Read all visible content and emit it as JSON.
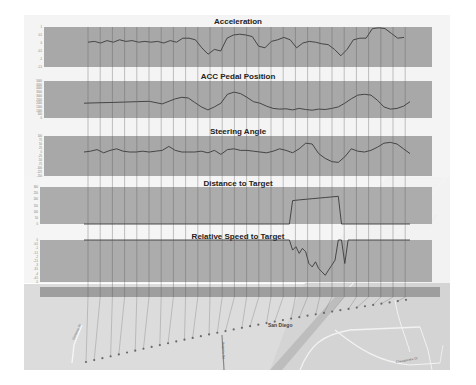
{
  "figure": {
    "colors": {
      "plot_bg": "#a8a8a8",
      "trace": "#3a3a3a",
      "panel_bg": "#f4f4f4",
      "map_bg": "#dcdcdc",
      "route_dots": "#6a6a6a",
      "sync_lines": "#555555"
    }
  },
  "chart_data": [
    {
      "type": "line",
      "title": "Acceleration",
      "xlabel": "",
      "ylabel": "",
      "yticks": [
        "1",
        "0.5",
        "0",
        "-0.5",
        "-1",
        "-1.5"
      ],
      "ylim": [
        -1.5,
        1
      ],
      "grid": false,
      "x": [
        0,
        2,
        4,
        6,
        8,
        10,
        12,
        14,
        16,
        18,
        20,
        22,
        24,
        26,
        28,
        30,
        32,
        34,
        36,
        38,
        40,
        42,
        44,
        46,
        48,
        50,
        52,
        54,
        56,
        58,
        60,
        62,
        64,
        66,
        68,
        70,
        72,
        74,
        76,
        78,
        80,
        82,
        84,
        86,
        88,
        90,
        92,
        94,
        96,
        98,
        100
      ],
      "values": [
        0.05,
        0.1,
        0.0,
        0.15,
        0.05,
        0.2,
        0.1,
        0.15,
        0.05,
        0.1,
        0.05,
        0.1,
        0.0,
        0.15,
        0.05,
        0.3,
        0.3,
        0.2,
        -0.3,
        -0.7,
        -0.4,
        -0.5,
        0.3,
        0.5,
        0.55,
        0.5,
        0.4,
        -0.2,
        -0.3,
        0.1,
        0.2,
        0.35,
        0.2,
        -0.3,
        0.0,
        0.1,
        0.05,
        -0.05,
        -0.1,
        -0.4,
        -0.8,
        -0.4,
        0.2,
        0.3,
        0.3,
        0.9,
        0.95,
        0.9,
        0.6,
        0.3,
        0.35
      ]
    },
    {
      "type": "line",
      "title": "ACC Pedal Position",
      "xlabel": "",
      "ylabel": "",
      "yticks": [
        "5000",
        "4500",
        "4000",
        "3500",
        "3000",
        "2500",
        "2000",
        "1500",
        "1000",
        "500",
        "0"
      ],
      "ylim": [
        0,
        5000
      ],
      "grid": false,
      "x": [
        0,
        4,
        8,
        12,
        16,
        20,
        24,
        28,
        30,
        32,
        34,
        36,
        38,
        40,
        42,
        44,
        46,
        48,
        50,
        52,
        54,
        56,
        58,
        60,
        62,
        64,
        66,
        68,
        70,
        72,
        74,
        76,
        78,
        80,
        82,
        84,
        86,
        88,
        90,
        92,
        94,
        96,
        98,
        100
      ],
      "values": [
        2000,
        2050,
        2100,
        2150,
        2200,
        2250,
        1900,
        2600,
        2800,
        2700,
        2100,
        1500,
        1100,
        1500,
        2000,
        3200,
        3500,
        3300,
        2800,
        2200,
        2000,
        1600,
        1300,
        1200,
        1250,
        1100,
        1300,
        1150,
        1050,
        1200,
        1150,
        1300,
        1500,
        2000,
        2600,
        3100,
        3200,
        3100,
        2400,
        1500,
        1200,
        1300,
        1600,
        2200
      ]
    },
    {
      "type": "line",
      "title": "Steering Angle",
      "xlabel": "",
      "ylabel": "",
      "yticks": [
        "100",
        "75",
        "50",
        "25",
        "0",
        "-25",
        "-50",
        "-75",
        "-100",
        "-125",
        "-150"
      ],
      "ylim": [
        -150,
        100
      ],
      "grid": false,
      "x": [
        0,
        2,
        4,
        6,
        8,
        10,
        12,
        14,
        16,
        18,
        20,
        22,
        24,
        26,
        28,
        30,
        32,
        34,
        36,
        38,
        40,
        42,
        44,
        46,
        48,
        50,
        52,
        54,
        56,
        58,
        60,
        62,
        64,
        66,
        68,
        70,
        72,
        74,
        76,
        78,
        80,
        82,
        84,
        86,
        88,
        90,
        92,
        94,
        96,
        98,
        100
      ],
      "values": [
        0,
        5,
        15,
        -5,
        10,
        20,
        5,
        0,
        0,
        5,
        0,
        5,
        10,
        35,
        10,
        0,
        0,
        0,
        5,
        -5,
        10,
        -15,
        15,
        20,
        10,
        10,
        5,
        0,
        -5,
        5,
        20,
        10,
        -5,
        20,
        55,
        50,
        -10,
        -40,
        -60,
        -65,
        -30,
        20,
        5,
        0,
        10,
        30,
        55,
        60,
        50,
        20,
        -10
      ]
    },
    {
      "type": "line",
      "title": "Distance to Target",
      "xlabel": "",
      "ylabel": "",
      "yticks": [
        "300",
        "250",
        "200",
        "150",
        "100",
        "50",
        "0"
      ],
      "ylim": [
        0,
        300
      ],
      "grid": false,
      "x": [
        0,
        10,
        20,
        30,
        40,
        50,
        60,
        63,
        64,
        66,
        70,
        74,
        78,
        79,
        80,
        100
      ],
      "values": [
        0,
        0,
        0,
        0,
        0,
        0,
        0,
        0,
        190,
        195,
        205,
        215,
        225,
        0,
        0,
        0
      ]
    },
    {
      "type": "line",
      "title": "Relative Speed to Target",
      "xlabel": "",
      "ylabel": "",
      "yticks": [
        "0",
        "-0.5",
        "-1",
        "-1.5",
        "-2",
        "-2.5",
        "-3",
        "-3.5",
        "-4",
        "-4.5",
        "-5"
      ],
      "ylim": [
        -5,
        0
      ],
      "grid": false,
      "x": [
        0,
        10,
        20,
        30,
        40,
        50,
        60,
        63,
        64,
        65,
        66,
        67,
        68,
        69,
        70,
        71,
        72,
        73,
        74,
        75,
        76,
        77,
        78,
        79,
        80,
        81,
        82,
        100
      ],
      "values": [
        0,
        0,
        0,
        0,
        0,
        0,
        0,
        0,
        -1.2,
        -0.8,
        -1.6,
        -1.0,
        -1.4,
        -2.8,
        -3.2,
        -2.6,
        -3.4,
        -3.8,
        -4.2,
        -3.6,
        -3.0,
        -2.4,
        0,
        0,
        -2.8,
        0,
        0,
        0
      ]
    }
  ],
  "panels": {
    "acceleration": {
      "title": "Acceleration"
    },
    "pedal": {
      "title": "ACC Pedal Position"
    },
    "steering": {
      "title": "Steering Angle"
    },
    "distance": {
      "title": "Distance to Target"
    },
    "relspeed": {
      "title": "Relative Speed to Target"
    }
  },
  "map": {
    "city_label": "San Diego",
    "street_labels": [
      "Genesee St",
      "Regents Rd",
      "Chesapeake Dr",
      "I-805 HW"
    ]
  }
}
